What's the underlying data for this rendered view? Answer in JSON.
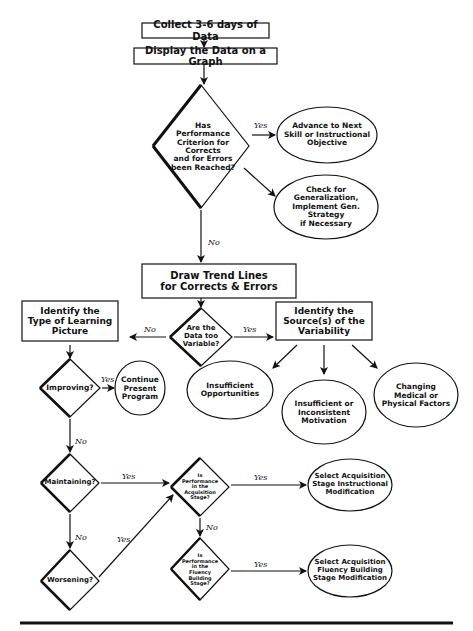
{
  "diagram": {
    "type": "flowchart",
    "nodes": {
      "collect": "Collect 3-6 days of Data",
      "display": "Display the Data on a Graph",
      "criterion": "Has\nPerformance\nCriterion for\nCorrects\nand for Errors\nbeen Reached?",
      "advance": "Advance to Next\nSkill or Instructional\nObjective",
      "generalization": "Check for\nGeneralization,\nImplement Gen. Strategy\nif Necessary",
      "trend": "Draw Trend Lines\nfor Corrects & Errors",
      "variable": "Are the\nData too\nVariable?",
      "learning_picture": "Identify the\nType of Learning\nPicture",
      "source": "Identify the\nSource(s) of the\nVariability",
      "insufficient_opp": "Insufficient\nOpportunities",
      "motivation": "Insufficient or\nInconsistent\nMotivation",
      "medical": "Changing\nMedical or\nPhysical Factors",
      "improving": "Improving?",
      "continue": "Continue\nPresent\nProgram",
      "maintaining": "Maintaining?",
      "worsening": "Worsening?",
      "acq_stage": "Is\nPerformance\nin the\nAcquisition\nStage?",
      "fluency_stage": "Is\nPerformance\nin the\nFluency\nBuilding\nStage?",
      "acq_mod": "Select Acquisition\nStage Instructional\nModification",
      "fluency_mod": "Select Acquisition\nFluency Building\nStage Modification"
    },
    "edge_labels": {
      "yes": "Yes",
      "no": "No"
    }
  }
}
